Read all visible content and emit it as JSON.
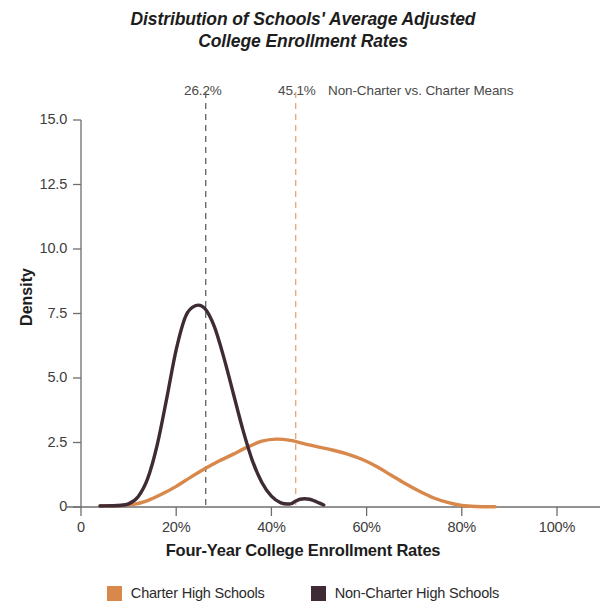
{
  "title": {
    "line1": "Distribution of Schools' Average Adjusted",
    "line2": "College Enrollment Rates"
  },
  "annotations": {
    "noncharter_mean_label": "26.2%",
    "charter_mean_label": "45.1%",
    "means_caption": "Non-Charter vs. Charter Means"
  },
  "axes": {
    "ylabel": "Density",
    "xlabel": "Four-Year College Enrollment Rates",
    "yticks": [
      "15.0",
      "12.5",
      "10.0",
      "7.5",
      "5.0",
      "2.5",
      "0"
    ],
    "xticks": [
      "0",
      "20%",
      "40%",
      "60%",
      "80%",
      "100%"
    ]
  },
  "legend": {
    "items": [
      {
        "label": "Charter High Schools",
        "color": "#D9884B"
      },
      {
        "label": "Non-Charter High Schools",
        "color": "#3E2B35"
      }
    ]
  },
  "colors": {
    "charter": "#D9884B",
    "noncharter": "#3E2B35",
    "charter_rule": "#E8A882",
    "noncharter_rule": "#6B6B6B",
    "axis": "#6e6e6e",
    "text": "#2b2b2b"
  },
  "chart_data": {
    "type": "line",
    "title": "Distribution of Schools' Average Adjusted College Enrollment Rates",
    "xlabel": "Four-Year College Enrollment Rates",
    "ylabel": "Density",
    "xlim": [
      0,
      100
    ],
    "ylim": [
      0,
      15
    ],
    "grid": false,
    "legend_position": "bottom",
    "xtick_values": [
      0,
      20,
      40,
      60,
      80,
      100
    ],
    "ytick_values": [
      0,
      2.5,
      5.0,
      7.5,
      10.0,
      12.5,
      15.0
    ],
    "vlines": [
      {
        "name": "Non-Charter Mean",
        "x": 26.2,
        "label": "26.2%",
        "color": "#6B6B6B",
        "style": "dashed"
      },
      {
        "name": "Charter Mean",
        "x": 45.1,
        "label": "45.1%",
        "color": "#E8A882",
        "style": "dashed"
      }
    ],
    "series": [
      {
        "name": "Charter High Schools",
        "color": "#D9884B",
        "x": [
          4,
          8,
          11,
          14,
          17,
          20,
          23,
          26,
          29,
          32,
          35,
          38,
          41,
          44,
          47,
          50,
          53,
          56,
          59,
          62,
          65,
          68,
          71,
          74,
          77,
          80,
          83,
          87
        ],
        "y": [
          0.05,
          0.06,
          0.1,
          0.25,
          0.5,
          0.8,
          1.15,
          1.48,
          1.78,
          2.05,
          2.32,
          2.55,
          2.63,
          2.58,
          2.45,
          2.32,
          2.2,
          2.05,
          1.85,
          1.58,
          1.25,
          0.92,
          0.62,
          0.36,
          0.18,
          0.06,
          0.02,
          0.01
        ]
      },
      {
        "name": "Non-Charter High Schools",
        "color": "#3E2B35",
        "x": [
          4,
          8,
          10,
          12,
          14,
          16,
          18,
          20,
          22,
          24,
          26,
          28,
          30,
          32,
          34,
          36,
          38,
          40,
          42,
          44,
          45,
          46,
          47,
          48,
          49,
          50,
          51
        ],
        "y": [
          0.04,
          0.06,
          0.12,
          0.4,
          1.1,
          2.4,
          4.2,
          6.1,
          7.4,
          7.8,
          7.7,
          7.0,
          5.8,
          4.4,
          3.0,
          1.8,
          0.95,
          0.42,
          0.16,
          0.12,
          0.22,
          0.3,
          0.32,
          0.3,
          0.24,
          0.16,
          0.08
        ]
      }
    ]
  }
}
